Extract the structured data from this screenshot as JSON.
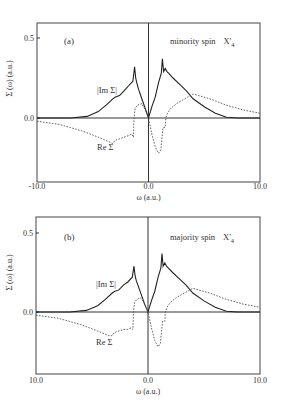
{
  "chart_data": [
    {
      "type": "line",
      "panel_label": "(a)",
      "title": "minority spin  X'4",
      "annotation_main": "minority spin",
      "annotation_state": "X'",
      "annotation_sub": "4",
      "xlabel": "ω (a.u.)",
      "ylabel": "Σ (ω) (a.u.)",
      "xlim": [
        -10.0,
        10.0
      ],
      "ylim": [
        -0.35,
        0.6
      ],
      "x_ticks": [
        "-10.0",
        "0.0",
        "10.0"
      ],
      "y_ticks": [
        "0.5",
        "0.0"
      ],
      "grid": false,
      "series": [
        {
          "name": "|Im Σ|",
          "style": "solid",
          "x": [
            -10.0,
            -7.0,
            -5.5,
            -4.5,
            -3.8,
            -3.2,
            -3.0,
            -2.6,
            -2.2,
            -1.8,
            -1.4,
            -1.25,
            -1.15,
            -1.05,
            -0.9,
            -0.6,
            -0.3,
            0.0,
            0.3,
            0.6,
            0.9,
            1.15,
            1.25,
            1.35,
            1.5,
            1.65,
            1.8,
            2.2,
            2.8,
            3.4,
            4.0,
            5.0,
            6.0,
            7.0,
            8.0,
            10.0
          ],
          "y": [
            0.0,
            0.0,
            0.01,
            0.04,
            0.08,
            0.12,
            0.13,
            0.14,
            0.17,
            0.2,
            0.23,
            0.32,
            0.25,
            0.22,
            0.18,
            0.12,
            0.06,
            0.0,
            0.07,
            0.13,
            0.22,
            0.28,
            0.37,
            0.29,
            0.31,
            0.29,
            0.28,
            0.25,
            0.21,
            0.17,
            0.12,
            0.07,
            0.03,
            0.005,
            0.0,
            0.0
          ]
        },
        {
          "name": "Re Σ",
          "style": "dashed",
          "x": [
            -10.0,
            -8.0,
            -6.0,
            -4.5,
            -3.5,
            -3.2,
            -3.0,
            -2.6,
            -2.2,
            -1.8,
            -1.5,
            -1.35,
            -1.3,
            -1.2,
            -1.0,
            -0.6,
            -0.3,
            0.0,
            0.3,
            0.6,
            0.9,
            1.1,
            1.3,
            1.35,
            1.5,
            1.55,
            1.7,
            2.0,
            2.5,
            3.0,
            3.5,
            4.0,
            4.5,
            5.5,
            7.0,
            8.5,
            10.0
          ],
          "y": [
            -0.02,
            -0.04,
            -0.08,
            -0.12,
            -0.15,
            -0.16,
            -0.14,
            -0.13,
            -0.12,
            -0.11,
            -0.1,
            -0.12,
            0.0,
            0.06,
            0.08,
            0.09,
            0.05,
            0.0,
            -0.1,
            -0.18,
            -0.22,
            -0.2,
            -0.06,
            -0.06,
            -0.06,
            0.0,
            0.03,
            0.06,
            0.09,
            0.11,
            0.13,
            0.15,
            0.14,
            0.12,
            0.08,
            0.05,
            0.03
          ]
        }
      ]
    },
    {
      "type": "line",
      "panel_label": "(b)",
      "title": "majority spin  X'4",
      "annotation_main": "majority spin",
      "annotation_state": "X'",
      "annotation_sub": "4",
      "xlabel": "ω (a.u.)",
      "ylabel": "Σ (ω) (a.u.)",
      "xlim": [
        -10.0,
        10.0
      ],
      "ylim": [
        -0.35,
        0.6
      ],
      "x_ticks": [
        "10.0",
        "0.0",
        "10.0"
      ],
      "y_ticks": [
        "0.5",
        "0.0"
      ],
      "grid": false,
      "series": [
        {
          "name": "|Im Σ|",
          "style": "solid",
          "x": [
            -10.0,
            -7.0,
            -5.5,
            -4.5,
            -3.8,
            -3.2,
            -3.0,
            -2.6,
            -2.2,
            -1.8,
            -1.4,
            -1.25,
            -1.15,
            -1.05,
            -0.9,
            -0.6,
            -0.3,
            0.0,
            0.3,
            0.6,
            0.9,
            1.15,
            1.25,
            1.35,
            1.5,
            1.65,
            1.8,
            2.2,
            2.8,
            3.4,
            4.0,
            5.0,
            6.0,
            7.0,
            8.0,
            10.0
          ],
          "y": [
            0.0,
            0.0,
            0.01,
            0.04,
            0.08,
            0.12,
            0.13,
            0.14,
            0.17,
            0.19,
            0.22,
            0.29,
            0.23,
            0.2,
            0.17,
            0.11,
            0.05,
            0.0,
            0.07,
            0.13,
            0.22,
            0.28,
            0.37,
            0.29,
            0.31,
            0.29,
            0.28,
            0.25,
            0.21,
            0.17,
            0.12,
            0.07,
            0.03,
            0.005,
            0.0,
            0.0
          ]
        },
        {
          "name": "Re Σ",
          "style": "dashed",
          "x": [
            -10.0,
            -8.0,
            -6.0,
            -4.5,
            -3.5,
            -3.2,
            -3.0,
            -2.6,
            -2.2,
            -1.8,
            -1.5,
            -1.35,
            -1.3,
            -1.2,
            -1.0,
            -0.6,
            -0.3,
            0.0,
            0.3,
            0.6,
            0.9,
            1.1,
            1.3,
            1.35,
            1.5,
            1.55,
            1.7,
            2.0,
            2.5,
            3.0,
            3.5,
            4.0,
            4.5,
            5.5,
            7.0,
            8.5,
            10.0
          ],
          "y": [
            -0.02,
            -0.04,
            -0.08,
            -0.12,
            -0.15,
            -0.15,
            -0.13,
            -0.12,
            -0.11,
            -0.11,
            -0.1,
            -0.11,
            0.0,
            0.06,
            0.08,
            0.09,
            0.05,
            0.0,
            -0.1,
            -0.18,
            -0.22,
            -0.2,
            -0.06,
            -0.06,
            -0.06,
            0.0,
            0.03,
            0.06,
            0.09,
            0.11,
            0.13,
            0.15,
            0.14,
            0.12,
            0.08,
            0.05,
            0.03
          ]
        }
      ]
    }
  ],
  "layout": {
    "panels": [
      {
        "left": 37,
        "right": 260,
        "top": 23,
        "bottom": 182,
        "y_at_0": 118,
        "y_at_05": 38,
        "xtick_y": 189,
        "xlabel_y": 200,
        "im_label_pos": [
          97,
          93
        ],
        "re_label_pos": [
          97,
          150
        ],
        "panel_label_pos": [
          64,
          44
        ],
        "annot_pos": [
          170,
          44
        ]
      },
      {
        "left": 36,
        "right": 260,
        "top": 217,
        "bottom": 374,
        "y_at_0": 312,
        "y_at_05": 233,
        "xtick_y": 383,
        "xlabel_y": 394,
        "im_label_pos": [
          96,
          287
        ],
        "re_label_pos": [
          96,
          345
        ],
        "panel_label_pos": [
          64,
          240
        ],
        "annot_pos": [
          170,
          240
        ]
      }
    ]
  }
}
